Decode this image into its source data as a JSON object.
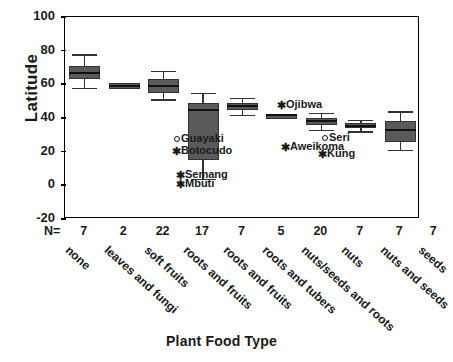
{
  "chart_data": {
    "type": "box",
    "title": "",
    "xlabel": "Plant Food Type",
    "ylabel": "Latitude",
    "ylim": [
      -20,
      100
    ],
    "yticks": [
      100,
      80,
      60,
      40,
      20,
      0,
      -20
    ],
    "grid": false,
    "legend": "none",
    "n_label": "N=",
    "categories": [
      "none",
      "leaves and fungi",
      "soft fruits",
      "roots and fruits",
      "roots and fruits",
      "roots and tubers",
      "nuts/seeds and roots",
      "nuts",
      "nuts and seeds",
      "seeds"
    ],
    "boxes": [
      {
        "category": "none",
        "n": 7,
        "whisker_low": 58,
        "q1": 63,
        "median": 67,
        "q3": 71,
        "whisker_high": 78
      },
      {
        "category": "leaves and fungi",
        "n": 2,
        "whisker_low": 57,
        "q1": 57,
        "median": 59,
        "q3": 61,
        "whisker_high": 61
      },
      {
        "category": "soft fruits",
        "n": 22,
        "whisker_low": 51,
        "q1": 55,
        "median": 59,
        "q3": 63,
        "whisker_high": 68
      },
      {
        "category": "roots and fruits",
        "n": 17,
        "whisker_low": 4,
        "q1": 15,
        "median": 45,
        "q3": 49,
        "whisker_high": 55
      },
      {
        "category": "roots and fruits",
        "n": 7,
        "whisker_low": 42,
        "q1": 45,
        "median": 47,
        "q3": 49,
        "whisker_high": 52
      },
      {
        "category": "roots and tubers",
        "n": 5,
        "whisker_low": 42,
        "q1": 42,
        "median": 42,
        "q3": 42,
        "whisker_high": 42
      },
      {
        "category": "nuts/seeds and roots",
        "n": 20,
        "whisker_low": 33,
        "q1": 36,
        "median": 38,
        "q3": 40,
        "whisker_high": 43
      },
      {
        "category": "nuts",
        "n": 7,
        "whisker_low": 32,
        "q1": 34,
        "median": 35,
        "q3": 37,
        "whisker_high": 39
      },
      {
        "category": "nuts and seeds",
        "n": 7,
        "whisker_low": 21,
        "q1": 26,
        "median": 33,
        "q3": 38,
        "whisker_high": 44
      }
    ],
    "category_counts": [
      7,
      2,
      22,
      17,
      7,
      5,
      20,
      7,
      7
    ],
    "annotations": [
      {
        "label": "Guayaki",
        "marker": "open-circle",
        "value": 23
      },
      {
        "label": "Botocudo",
        "marker": "asterisk",
        "value": 19
      },
      {
        "label": "Semang",
        "marker": "asterisk",
        "value": 5
      },
      {
        "label": "Mbuti",
        "marker": "asterisk",
        "value": 2
      },
      {
        "label": "Ojibwa",
        "marker": "asterisk",
        "value": 48
      },
      {
        "label": "Aweikoma",
        "marker": "asterisk",
        "value": 28
      },
      {
        "label": "Seri",
        "marker": "open-circle",
        "value": 29
      },
      {
        "label": "Kung",
        "marker": "asterisk",
        "value": 24
      }
    ]
  },
  "style": {
    "box_fill": "#5a5a5a",
    "axis_color": "#000000",
    "text_color": "#1a1a1a"
  }
}
